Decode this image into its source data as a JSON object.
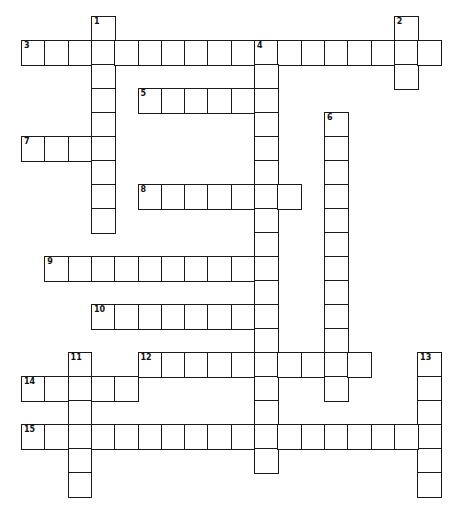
{
  "puzzle": {
    "cell_width": 23.3,
    "cell_height": 24,
    "origin_x": 21,
    "origin_y": 16,
    "colors": {
      "border": "#1a1a1a",
      "cell_fill": "#ffffff",
      "number": "#111111"
    },
    "entries": [
      {
        "number": "1",
        "direction": "down",
        "row": 0,
        "col": 3,
        "length": 9
      },
      {
        "number": "2",
        "direction": "down",
        "row": 0,
        "col": 16,
        "length": 3
      },
      {
        "number": "3",
        "direction": "across",
        "row": 1,
        "col": 0,
        "length": 18
      },
      {
        "number": "4",
        "direction": "down",
        "row": 1,
        "col": 10,
        "length": 18
      },
      {
        "number": "5",
        "direction": "across",
        "row": 3,
        "col": 5,
        "length": 6
      },
      {
        "number": "6",
        "direction": "down",
        "row": 4,
        "col": 13,
        "length": 12
      },
      {
        "number": "7",
        "direction": "across",
        "row": 5,
        "col": 0,
        "length": 4
      },
      {
        "number": "8",
        "direction": "across",
        "row": 7,
        "col": 5,
        "length": 7
      },
      {
        "number": "9",
        "direction": "across",
        "row": 10,
        "col": 1,
        "length": 10
      },
      {
        "number": "10",
        "direction": "across",
        "row": 12,
        "col": 3,
        "length": 8
      },
      {
        "number": "11",
        "direction": "down",
        "row": 14,
        "col": 2,
        "length": 6
      },
      {
        "number": "12",
        "direction": "across",
        "row": 14,
        "col": 5,
        "length": 10
      },
      {
        "number": "13",
        "direction": "down",
        "row": 14,
        "col": 17,
        "length": 6
      },
      {
        "number": "14",
        "direction": "across",
        "row": 15,
        "col": 0,
        "length": 5
      },
      {
        "number": "15",
        "direction": "across",
        "row": 17,
        "col": 0,
        "length": 18
      }
    ]
  }
}
